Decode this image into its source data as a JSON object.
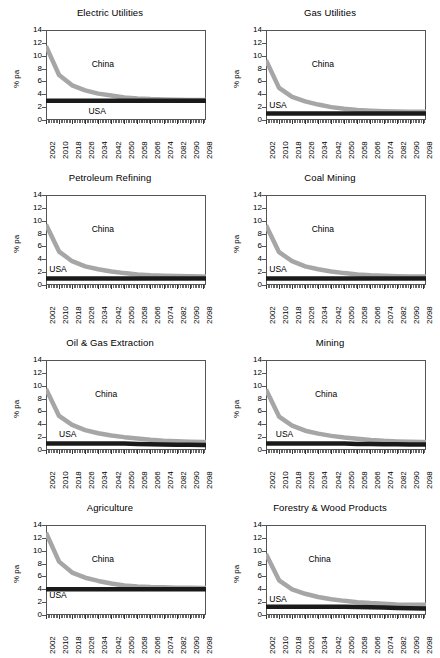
{
  "figure": {
    "axis": {
      "ylabel": "% pa",
      "yticks": [
        0,
        2,
        4,
        6,
        8,
        10,
        12,
        14
      ],
      "ylim": [
        0,
        14
      ],
      "xlim": [
        2002,
        2100
      ],
      "xtick_labels": [
        "2002",
        "2010",
        "2018",
        "2026",
        "2034",
        "2042",
        "2050",
        "2058",
        "2066",
        "2074",
        "2082",
        "2090",
        "2098"
      ],
      "xtick_step_years": 8,
      "minor_tick_step_years": 1
    },
    "legend": {
      "china": "China",
      "usa": "USA"
    },
    "colors": {
      "china": "#a6a6a6",
      "usa": "#1a1a1a",
      "grid": "#8d8d8d",
      "frame": "#555555"
    }
  },
  "chart_data": [
    {
      "type": "line",
      "title": "Electric Utilities",
      "xlabel": "",
      "ylabel": "% pa",
      "ylim": [
        0,
        14
      ],
      "xlim": [
        2002,
        2100
      ],
      "grid": true,
      "annotations": [
        {
          "text": "China",
          "x": 2030,
          "y": 8.6
        },
        {
          "text": "USA",
          "x": 2028,
          "y": 1.2
        }
      ],
      "x": [
        2002,
        2010,
        2018,
        2026,
        2034,
        2042,
        2050,
        2058,
        2066,
        2074,
        2082,
        2090,
        2098,
        2100
      ],
      "series": [
        {
          "name": "China",
          "values": [
            11.5,
            7.0,
            5.4,
            4.6,
            4.1,
            3.8,
            3.5,
            3.35,
            3.25,
            3.2,
            3.15,
            3.12,
            3.1,
            3.1
          ]
        },
        {
          "name": "USA",
          "values": [
            3.0,
            3.0,
            3.0,
            3.0,
            3.0,
            3.0,
            3.0,
            3.0,
            3.0,
            3.0,
            3.0,
            3.0,
            3.0,
            3.0
          ]
        }
      ]
    },
    {
      "type": "line",
      "title": "Gas Utilities",
      "xlabel": "",
      "ylabel": "% pa",
      "ylim": [
        0,
        14
      ],
      "xlim": [
        2002,
        2100
      ],
      "grid": true,
      "annotations": [
        {
          "text": "China",
          "x": 2030,
          "y": 8.6
        },
        {
          "text": "USA",
          "x": 2004,
          "y": 2.2
        }
      ],
      "x": [
        2002,
        2010,
        2018,
        2026,
        2034,
        2042,
        2050,
        2058,
        2066,
        2074,
        2082,
        2090,
        2098,
        2100
      ],
      "series": [
        {
          "name": "China",
          "values": [
            9.3,
            5.0,
            3.6,
            2.9,
            2.4,
            2.0,
            1.75,
            1.55,
            1.45,
            1.38,
            1.33,
            1.3,
            1.28,
            1.28
          ]
        },
        {
          "name": "USA",
          "values": [
            1.0,
            1.0,
            1.0,
            1.0,
            1.0,
            1.0,
            1.0,
            1.0,
            1.0,
            1.0,
            1.0,
            1.0,
            1.0,
            1.0
          ]
        }
      ]
    },
    {
      "type": "line",
      "title": "Petroleum Refining",
      "xlabel": "",
      "ylabel": "% pa",
      "ylim": [
        0,
        14
      ],
      "xlim": [
        2002,
        2100
      ],
      "grid": true,
      "annotations": [
        {
          "text": "China",
          "x": 2030,
          "y": 8.6
        },
        {
          "text": "USA",
          "x": 2004,
          "y": 2.4
        }
      ],
      "x": [
        2002,
        2010,
        2018,
        2026,
        2034,
        2042,
        2050,
        2058,
        2066,
        2074,
        2082,
        2090,
        2098,
        2100
      ],
      "series": [
        {
          "name": "China",
          "values": [
            9.4,
            5.2,
            3.7,
            2.9,
            2.45,
            2.1,
            1.85,
            1.65,
            1.52,
            1.45,
            1.4,
            1.36,
            1.33,
            1.33
          ]
        },
        {
          "name": "USA",
          "values": [
            1.0,
            1.0,
            1.0,
            1.0,
            1.0,
            1.0,
            1.0,
            1.0,
            1.0,
            1.0,
            1.0,
            1.0,
            1.0,
            1.0
          ]
        }
      ]
    },
    {
      "type": "line",
      "title": "Coal Mining",
      "xlabel": "",
      "ylabel": "% pa",
      "ylim": [
        0,
        14
      ],
      "xlim": [
        2002,
        2100
      ],
      "grid": true,
      "annotations": [
        {
          "text": "China",
          "x": 2030,
          "y": 8.6
        },
        {
          "text": "USA",
          "x": 2004,
          "y": 2.4
        }
      ],
      "x": [
        2002,
        2010,
        2018,
        2026,
        2034,
        2042,
        2050,
        2058,
        2066,
        2074,
        2082,
        2090,
        2098,
        2100
      ],
      "series": [
        {
          "name": "China",
          "values": [
            9.3,
            5.1,
            3.7,
            2.9,
            2.45,
            2.1,
            1.85,
            1.65,
            1.5,
            1.43,
            1.38,
            1.34,
            1.32,
            1.32
          ]
        },
        {
          "name": "USA",
          "values": [
            1.0,
            1.0,
            1.0,
            1.0,
            1.0,
            1.0,
            1.0,
            1.0,
            1.0,
            1.0,
            1.0,
            1.0,
            1.0,
            1.0
          ]
        }
      ]
    },
    {
      "type": "line",
      "title": "Oil & Gas Extraction",
      "xlabel": "",
      "ylabel": "% pa",
      "ylim": [
        0,
        14
      ],
      "xlim": [
        2002,
        2100
      ],
      "grid": true,
      "annotations": [
        {
          "text": "China",
          "x": 2032,
          "y": 8.6
        },
        {
          "text": "USA",
          "x": 2010,
          "y": 2.3
        }
      ],
      "x": [
        2002,
        2010,
        2018,
        2026,
        2034,
        2042,
        2050,
        2058,
        2066,
        2074,
        2082,
        2090,
        2098,
        2100
      ],
      "series": [
        {
          "name": "China",
          "values": [
            9.5,
            5.3,
            3.9,
            3.1,
            2.6,
            2.25,
            2.0,
            1.8,
            1.6,
            1.45,
            1.36,
            1.3,
            1.26,
            1.26
          ]
        },
        {
          "name": "USA",
          "values": [
            1.0,
            1.0,
            1.0,
            1.0,
            1.0,
            1.0,
            1.0,
            0.95,
            0.9,
            0.85,
            0.82,
            0.8,
            0.78,
            0.78
          ]
        }
      ]
    },
    {
      "type": "line",
      "title": "Mining",
      "xlabel": "",
      "ylabel": "% pa",
      "ylim": [
        0,
        14
      ],
      "xlim": [
        2002,
        2100
      ],
      "grid": true,
      "annotations": [
        {
          "text": "China",
          "x": 2032,
          "y": 8.6
        },
        {
          "text": "USA",
          "x": 2008,
          "y": 2.3
        }
      ],
      "x": [
        2002,
        2010,
        2018,
        2026,
        2034,
        2042,
        2050,
        2058,
        2066,
        2074,
        2082,
        2090,
        2098,
        2100
      ],
      "series": [
        {
          "name": "China",
          "values": [
            9.4,
            5.2,
            3.8,
            3.0,
            2.55,
            2.2,
            1.95,
            1.75,
            1.55,
            1.42,
            1.34,
            1.28,
            1.25,
            1.25
          ]
        },
        {
          "name": "USA",
          "values": [
            1.0,
            1.0,
            1.0,
            1.0,
            1.0,
            1.0,
            1.0,
            0.95,
            0.92,
            0.9,
            0.88,
            0.86,
            0.85,
            0.85
          ]
        }
      ]
    },
    {
      "type": "line",
      "title": "Agriculture",
      "xlabel": "",
      "ylabel": "% pa",
      "ylim": [
        0,
        14
      ],
      "xlim": [
        2002,
        2100
      ],
      "grid": true,
      "annotations": [
        {
          "text": "China",
          "x": 2030,
          "y": 8.5
        },
        {
          "text": "USA",
          "x": 2004,
          "y": 3.0
        }
      ],
      "x": [
        2002,
        2010,
        2018,
        2026,
        2034,
        2042,
        2050,
        2058,
        2066,
        2074,
        2082,
        2090,
        2098,
        2100
      ],
      "series": [
        {
          "name": "China",
          "values": [
            12.8,
            8.3,
            6.6,
            5.8,
            5.3,
            4.9,
            4.6,
            4.45,
            4.35,
            4.3,
            4.25,
            4.22,
            4.2,
            4.2
          ]
        },
        {
          "name": "USA",
          "values": [
            4.0,
            4.0,
            4.0,
            4.0,
            4.0,
            4.0,
            4.0,
            4.0,
            4.0,
            4.0,
            4.0,
            4.0,
            4.0,
            4.0
          ]
        }
      ]
    },
    {
      "type": "line",
      "title": "Forestry & Wood Products",
      "xlabel": "",
      "ylabel": "% pa",
      "ylim": [
        0,
        14
      ],
      "xlim": [
        2002,
        2100
      ],
      "grid": true,
      "annotations": [
        {
          "text": "China",
          "x": 2028,
          "y": 8.5
        },
        {
          "text": "USA",
          "x": 2004,
          "y": 2.4
        }
      ],
      "x": [
        2002,
        2010,
        2018,
        2026,
        2034,
        2042,
        2050,
        2058,
        2066,
        2074,
        2082,
        2090,
        2098,
        2100
      ],
      "series": [
        {
          "name": "China",
          "values": [
            9.5,
            5.4,
            4.0,
            3.3,
            2.8,
            2.45,
            2.2,
            2.0,
            1.85,
            1.75,
            1.65,
            1.6,
            1.58,
            1.58
          ]
        },
        {
          "name": "USA",
          "values": [
            1.3,
            1.3,
            1.3,
            1.3,
            1.3,
            1.3,
            1.3,
            1.25,
            1.2,
            1.15,
            1.1,
            1.05,
            1.0,
            1.0
          ]
        }
      ]
    }
  ]
}
